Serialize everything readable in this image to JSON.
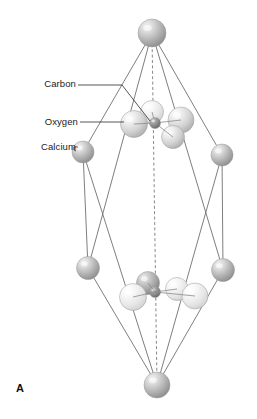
{
  "figure": {
    "panel_letter": "A",
    "caption_labels": [
      {
        "id": "carbon",
        "text": "Carbon",
        "x": 42,
        "y": 87,
        "color": "#1a1a1a"
      },
      {
        "id": "oxygen",
        "text": "Oxygen",
        "x": 42,
        "y": 125,
        "color": "#1a1a1a"
      },
      {
        "id": "calcium",
        "text": "Calcium",
        "x": 40,
        "y": 150,
        "color": "#1a1a1a"
      }
    ],
    "colors": {
      "edge_line": "#6f6f6f",
      "dashed_axis": "#7a7a7a",
      "leader_line": "#2b2b2b",
      "calcium_sphere": "#b8b8b8",
      "calcium_highlight": "#eaeaea",
      "oxygen_sphere": "#d8d8d8",
      "oxygen_highlight": "#f4f4f4",
      "oxygen_pale": "#e8e8e8",
      "carbon_sphere": "#8a8a8a",
      "carbon_highlight": "#c8c8c8",
      "background": "#ffffff"
    },
    "structure_name": "calcite rhombohedral unit cell",
    "vertices": [
      {
        "name": "top",
        "x": 152,
        "y": 33,
        "r": 14,
        "atom": "calcium"
      },
      {
        "name": "upper-left",
        "x": 83,
        "y": 152,
        "r": 11,
        "atom": "calcium"
      },
      {
        "name": "upper-right",
        "x": 222,
        "y": 155,
        "r": 11,
        "atom": "calcium"
      },
      {
        "name": "lower-left",
        "x": 88,
        "y": 268,
        "r": 11.5,
        "atom": "calcium"
      },
      {
        "name": "lower-right",
        "x": 223,
        "y": 270,
        "r": 11.5,
        "atom": "calcium"
      },
      {
        "name": "bottom",
        "x": 157,
        "y": 385,
        "r": 13,
        "atom": "calcium"
      }
    ],
    "carbonate_groups": [
      {
        "name": "upper-carbonate",
        "carbon": {
          "x": 155,
          "y": 123,
          "r": 5.5
        },
        "oxygens": [
          {
            "x": 152,
            "y": 112,
            "r": 11.5,
            "shade": "pale"
          },
          {
            "x": 134,
            "y": 124,
            "r": 13.5,
            "shade": "normal"
          },
          {
            "x": 181,
            "y": 120,
            "r": 13.0,
            "shade": "normal"
          },
          {
            "x": 173,
            "y": 137,
            "r": 11.5,
            "shade": "normal"
          }
        ]
      },
      {
        "name": "lower-carbonate",
        "carbon": {
          "x": 155,
          "y": 292,
          "r": 5.5
        },
        "oxygens": [
          {
            "x": 148,
            "y": 283,
            "r": 11.5,
            "shade": "dark"
          },
          {
            "x": 133,
            "y": 297,
            "r": 13.5,
            "shade": "pale"
          },
          {
            "x": 177,
            "y": 289,
            "r": 11.5,
            "shade": "pale"
          },
          {
            "x": 195,
            "y": 296,
            "r": 13.0,
            "shade": "pale"
          }
        ]
      }
    ],
    "cell_edges": [
      {
        "from": "top",
        "to": "upper-left"
      },
      {
        "from": "top",
        "to": "upper-right"
      },
      {
        "from": "top",
        "to": "lower-left"
      },
      {
        "from": "top",
        "to": "lower-right"
      },
      {
        "from": "upper-left",
        "to": "lower-left"
      },
      {
        "from": "upper-right",
        "to": "lower-right"
      },
      {
        "from": "upper-left",
        "to": "bottom"
      },
      {
        "from": "upper-right",
        "to": "bottom"
      },
      {
        "from": "lower-left",
        "to": "bottom"
      },
      {
        "from": "lower-right",
        "to": "bottom"
      }
    ],
    "axis": {
      "type": "dashed-vertical",
      "x1": 152,
      "y1": 33,
      "x2": 157,
      "y2": 385
    },
    "leaders": [
      {
        "id": "carbon-leader",
        "path": "M 78 85 L 122 85 L 150 121"
      },
      {
        "id": "oxygen-leader",
        "path": "M 80 122 L 124 122"
      },
      {
        "id": "calcium-leader",
        "path": "M 78 147 L 74 147 L 74 150 L 76 151"
      }
    ]
  }
}
